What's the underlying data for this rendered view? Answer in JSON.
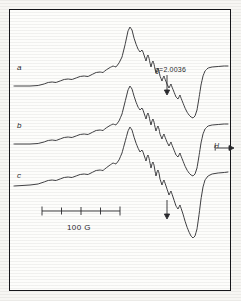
{
  "figure": {
    "type": "esr-spectrum",
    "background_color": "#f7f6f3",
    "frame_color": "#16161a",
    "trace_color": "#2a2a2e"
  },
  "labels": {
    "trace_a": "a",
    "trace_b": "b",
    "trace_c": "c",
    "g_value": "g=2.0036",
    "scale_bar": "100 G",
    "field_axis": "H"
  },
  "annotations": {
    "g_marker_arrow": "arrow-down",
    "lower_marker_arrow": "arrow-down",
    "field_arrow": "arrow-right"
  },
  "scale_bar": {
    "label": "100 G",
    "tick_count": 5,
    "x_start": 42,
    "x_end": 120,
    "y": 211
  },
  "chart_data": {
    "type": "line",
    "title": "",
    "xlabel": "H",
    "ylabel": "",
    "grid": false,
    "legend": [
      "a",
      "b",
      "c"
    ],
    "axis_units": "gauss",
    "scale_reference": {
      "length_px": 78,
      "value": 100,
      "unit": "G"
    },
    "markers": [
      {
        "name": "g=2.0036",
        "x": 167,
        "trace": "a"
      },
      {
        "name": "unlabeled-marker",
        "x": 167,
        "trace": "c"
      }
    ],
    "series": [
      {
        "name": "a",
        "baseline_y": 86,
        "points": [
          [
            14,
            86
          ],
          [
            22,
            86
          ],
          [
            30,
            86
          ],
          [
            38,
            85.5
          ],
          [
            44,
            84
          ],
          [
            48,
            82.5
          ],
          [
            52,
            82
          ],
          [
            56,
            82.5
          ],
          [
            60,
            81
          ],
          [
            64,
            79.5
          ],
          [
            68,
            79
          ],
          [
            72,
            79.5
          ],
          [
            76,
            78
          ],
          [
            80,
            76.5
          ],
          [
            84,
            76
          ],
          [
            88,
            76.5
          ],
          [
            92,
            74.5
          ],
          [
            96,
            72.5
          ],
          [
            100,
            72
          ],
          [
            103,
            72.5
          ],
          [
            106,
            70
          ],
          [
            110,
            67.5
          ],
          [
            113,
            66
          ],
          [
            116,
            67
          ],
          [
            119,
            63
          ],
          [
            122,
            57
          ],
          [
            125,
            45
          ],
          [
            128,
            31
          ],
          [
            130,
            27
          ],
          [
            132,
            30
          ],
          [
            134,
            38
          ],
          [
            136,
            44
          ],
          [
            138,
            49
          ],
          [
            140,
            52
          ],
          [
            142,
            50
          ],
          [
            143,
            52
          ],
          [
            145,
            58
          ],
          [
            146,
            61
          ],
          [
            147,
            57
          ],
          [
            148,
            55
          ],
          [
            149,
            58
          ],
          [
            150,
            63
          ],
          [
            151,
            67
          ],
          [
            152,
            63
          ],
          [
            153,
            61
          ],
          [
            154,
            64
          ],
          [
            155,
            69
          ],
          [
            156,
            73
          ],
          [
            157,
            70
          ],
          [
            158,
            68
          ],
          [
            159,
            71
          ],
          [
            160,
            76
          ],
          [
            162,
            81
          ],
          [
            163,
            78
          ],
          [
            164,
            76
          ],
          [
            165,
            79
          ],
          [
            167,
            84
          ],
          [
            169,
            88
          ],
          [
            170,
            86
          ],
          [
            171,
            84
          ],
          [
            172,
            87
          ],
          [
            174,
            92
          ],
          [
            176,
            97
          ],
          [
            178,
            99
          ],
          [
            179,
            97
          ],
          [
            180,
            95
          ],
          [
            181,
            98
          ],
          [
            183,
            103
          ],
          [
            185,
            108
          ],
          [
            187,
            112
          ],
          [
            189,
            115
          ],
          [
            191,
            117
          ],
          [
            193,
            118
          ],
          [
            195,
            116
          ],
          [
            197,
            110
          ],
          [
            199,
            98
          ],
          [
            201,
            85
          ],
          [
            203,
            76
          ],
          [
            205,
            71
          ],
          [
            208,
            68
          ],
          [
            212,
            67
          ],
          [
            218,
            66.5
          ],
          [
            224,
            66
          ],
          [
            228,
            66
          ]
        ]
      },
      {
        "name": "b",
        "baseline_y": 144,
        "points": [
          [
            14,
            144
          ],
          [
            22,
            144
          ],
          [
            30,
            144
          ],
          [
            38,
            143.5
          ],
          [
            44,
            142
          ],
          [
            48,
            140.5
          ],
          [
            52,
            140
          ],
          [
            56,
            140.5
          ],
          [
            60,
            139
          ],
          [
            64,
            137.5
          ],
          [
            68,
            137
          ],
          [
            72,
            137.5
          ],
          [
            76,
            136
          ],
          [
            80,
            134.5
          ],
          [
            84,
            134
          ],
          [
            88,
            134.5
          ],
          [
            92,
            132.5
          ],
          [
            96,
            130.5
          ],
          [
            100,
            130
          ],
          [
            103,
            130.5
          ],
          [
            106,
            128
          ],
          [
            110,
            125.5
          ],
          [
            113,
            124
          ],
          [
            116,
            125
          ],
          [
            119,
            121
          ],
          [
            122,
            114
          ],
          [
            125,
            102
          ],
          [
            128,
            90
          ],
          [
            130,
            86
          ],
          [
            132,
            89
          ],
          [
            134,
            96
          ],
          [
            136,
            102
          ],
          [
            138,
            107
          ],
          [
            140,
            110
          ],
          [
            142,
            108
          ],
          [
            143,
            110
          ],
          [
            145,
            116
          ],
          [
            146,
            119
          ],
          [
            147,
            115
          ],
          [
            148,
            113
          ],
          [
            149,
            116
          ],
          [
            150,
            121
          ],
          [
            151,
            125
          ],
          [
            152,
            121
          ],
          [
            153,
            119
          ],
          [
            154,
            122
          ],
          [
            155,
            127
          ],
          [
            156,
            131
          ],
          [
            157,
            128
          ],
          [
            158,
            126
          ],
          [
            159,
            129
          ],
          [
            160,
            134
          ],
          [
            162,
            139
          ],
          [
            163,
            136
          ],
          [
            164,
            134
          ],
          [
            165,
            137
          ],
          [
            167,
            142
          ],
          [
            169,
            146
          ],
          [
            170,
            144
          ],
          [
            171,
            142
          ],
          [
            172,
            145
          ],
          [
            174,
            150
          ],
          [
            176,
            155
          ],
          [
            178,
            157
          ],
          [
            179,
            155
          ],
          [
            180,
            153
          ],
          [
            181,
            156
          ],
          [
            183,
            161
          ],
          [
            185,
            166
          ],
          [
            187,
            170
          ],
          [
            189,
            173
          ],
          [
            191,
            175
          ],
          [
            193,
            176
          ],
          [
            195,
            174
          ],
          [
            197,
            168
          ],
          [
            199,
            156
          ],
          [
            201,
            143
          ],
          [
            203,
            134
          ],
          [
            205,
            129
          ],
          [
            208,
            126
          ],
          [
            212,
            125
          ],
          [
            218,
            124.5
          ],
          [
            224,
            124
          ],
          [
            228,
            124
          ]
        ]
      },
      {
        "name": "c",
        "baseline_y": 186,
        "points": [
          [
            14,
            186
          ],
          [
            22,
            185.5
          ],
          [
            30,
            185
          ],
          [
            38,
            184
          ],
          [
            44,
            182
          ],
          [
            48,
            180.5
          ],
          [
            52,
            180
          ],
          [
            56,
            180.5
          ],
          [
            60,
            179
          ],
          [
            64,
            177.5
          ],
          [
            68,
            177
          ],
          [
            72,
            177.5
          ],
          [
            76,
            176
          ],
          [
            80,
            174.5
          ],
          [
            84,
            174
          ],
          [
            88,
            174.5
          ],
          [
            92,
            172.5
          ],
          [
            96,
            170.5
          ],
          [
            100,
            170
          ],
          [
            103,
            170.5
          ],
          [
            106,
            168
          ],
          [
            110,
            165
          ],
          [
            113,
            163
          ],
          [
            116,
            164
          ],
          [
            119,
            160
          ],
          [
            122,
            153
          ],
          [
            125,
            142
          ],
          [
            128,
            131
          ],
          [
            130,
            127
          ],
          [
            132,
            130
          ],
          [
            134,
            137
          ],
          [
            136,
            143
          ],
          [
            138,
            148
          ],
          [
            140,
            152
          ],
          [
            142,
            150
          ],
          [
            143,
            152
          ],
          [
            145,
            158
          ],
          [
            146,
            161
          ],
          [
            147,
            157
          ],
          [
            148,
            155
          ],
          [
            149,
            158
          ],
          [
            150,
            163
          ],
          [
            151,
            168
          ],
          [
            152,
            164
          ],
          [
            153,
            162
          ],
          [
            154,
            165
          ],
          [
            155,
            171
          ],
          [
            156,
            176
          ],
          [
            157,
            172
          ],
          [
            158,
            170
          ],
          [
            159,
            173
          ],
          [
            160,
            179
          ],
          [
            162,
            185
          ],
          [
            163,
            182
          ],
          [
            164,
            180
          ],
          [
            165,
            183
          ],
          [
            167,
            189
          ],
          [
            169,
            195
          ],
          [
            170,
            193
          ],
          [
            171,
            191
          ],
          [
            172,
            194
          ],
          [
            174,
            200
          ],
          [
            176,
            206
          ],
          [
            178,
            209
          ],
          [
            179,
            207
          ],
          [
            180,
            205
          ],
          [
            181,
            208
          ],
          [
            183,
            214
          ],
          [
            185,
            221
          ],
          [
            187,
            227
          ],
          [
            189,
            232
          ],
          [
            191,
            236
          ],
          [
            193,
            238
          ],
          [
            195,
            236
          ],
          [
            197,
            229
          ],
          [
            199,
            215
          ],
          [
            201,
            199
          ],
          [
            203,
            187
          ],
          [
            205,
            180
          ],
          [
            208,
            176
          ],
          [
            212,
            174
          ],
          [
            218,
            173
          ],
          [
            224,
            172.5
          ],
          [
            228,
            172
          ]
        ]
      }
    ]
  }
}
